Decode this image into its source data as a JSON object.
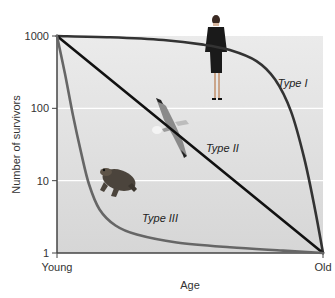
{
  "chart_data": {
    "type": "line",
    "title": "",
    "xlabel": "Age",
    "ylabel": "Number of survivors",
    "yscale": "log",
    "ylim": [
      1,
      1000
    ],
    "xlim": [
      0,
      1
    ],
    "grid": true,
    "x_tick_labels": [
      "Young",
      "Old"
    ],
    "y_ticks": [
      1000,
      100,
      10,
      1
    ],
    "y_tick_labels": [
      "1000",
      "100",
      "10",
      "1"
    ],
    "legend": "none",
    "series": [
      {
        "name": "Type I",
        "color": "#333333",
        "x": [
          0,
          0.2,
          0.4,
          0.55,
          0.65,
          0.75,
          0.82,
          0.88,
          0.93,
          0.97,
          1.0
        ],
        "y": [
          1000,
          960,
          880,
          760,
          640,
          450,
          250,
          90,
          20,
          4,
          1
        ]
      },
      {
        "name": "Type II",
        "color": "#111111",
        "x": [
          0,
          1.0
        ],
        "y": [
          1000,
          1
        ]
      },
      {
        "name": "Type III",
        "color": "#666666",
        "x": [
          0,
          0.03,
          0.06,
          0.09,
          0.12,
          0.16,
          0.22,
          0.3,
          0.45,
          0.65,
          0.85,
          1.0
        ],
        "y": [
          1000,
          300,
          80,
          25,
          9,
          4,
          2.4,
          1.8,
          1.4,
          1.2,
          1.08,
          1
        ]
      }
    ],
    "annotations": [
      {
        "text": "Type I",
        "x": 0.83,
        "y": 200
      },
      {
        "text": "Type II",
        "x": 0.56,
        "y": 25
      },
      {
        "text": "Type III",
        "x": 0.32,
        "y": 2.7
      }
    ],
    "illustrations": [
      {
        "name": "human",
        "represents": "Type I"
      },
      {
        "name": "bird",
        "represents": "Type II"
      },
      {
        "name": "frog",
        "represents": "Type III"
      }
    ]
  }
}
